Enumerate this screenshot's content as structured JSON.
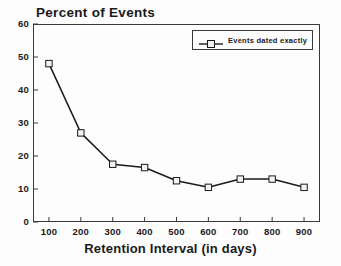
{
  "chart_data": {
    "type": "line",
    "title": "Percent of Events",
    "xlabel": "Retention Interval (in days)",
    "ylabel": "",
    "x": [
      100,
      200,
      300,
      400,
      500,
      600,
      700,
      800,
      900
    ],
    "xtick_labels": [
      "100",
      "200",
      "300",
      "400",
      "500",
      "600",
      "700",
      "800",
      "900"
    ],
    "ytick_labels": [
      "0",
      "10",
      "20",
      "30",
      "40",
      "50",
      "60"
    ],
    "yticks": [
      0,
      10,
      20,
      30,
      40,
      50,
      60
    ],
    "xlim": [
      50,
      950
    ],
    "ylim": [
      0,
      60
    ],
    "grid": false,
    "legend_position": "top-right",
    "series": [
      {
        "name": "Events dated exactly",
        "marker": "square",
        "color": "#1a1a1a",
        "values": [
          48,
          27,
          17.5,
          16.5,
          12.5,
          10.5,
          13,
          13,
          10.5
        ]
      }
    ]
  },
  "legend": {
    "entry_label": "Events dated exactly",
    "swatch_name": "line-square-marker-swatch"
  },
  "colors": {
    "line": "#1a1a1a",
    "axis": "#3a3a3a",
    "text": "#1a1a1a",
    "background": "#fdfdfd",
    "marker_fill": "#f2f2f2"
  }
}
